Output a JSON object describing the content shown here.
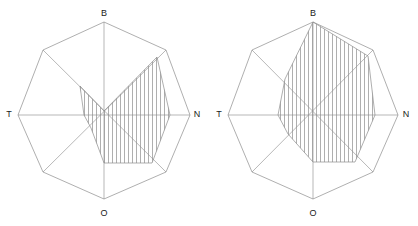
{
  "figure": {
    "width": 418,
    "height": 226,
    "background": "#ffffff",
    "stroke_color": "#8c8c8c",
    "axis_color": "#9a9a9a",
    "hatch_color": "#8c8c8c",
    "label_color": "#1a1a1a"
  },
  "chart_data": [
    {
      "id": "left-rose-diagram",
      "type": "line",
      "title": "",
      "xlabel": "",
      "ylabel": "",
      "grid": false,
      "legend": "none",
      "center": {
        "x": 104,
        "y": 111
      },
      "outer_radius": 88,
      "axis_labels": [
        {
          "name": "B",
          "angle_deg": 90,
          "x": 104,
          "y": 13
        },
        {
          "name": "N",
          "angle_deg": 0,
          "x": 197,
          "y": 114
        },
        {
          "name": "O",
          "angle_deg": 270,
          "x": 104,
          "y": 213
        },
        {
          "name": "T",
          "angle_deg": 180,
          "x": 9,
          "y": 114
        }
      ],
      "axes_drawn": [
        "B-O",
        "T-N",
        "NE-SW",
        "NW-SE"
      ],
      "outer_polygon": {
        "sides": 8,
        "categories": [
          "B",
          "BN",
          "N",
          "NO",
          "O",
          "OT",
          "T",
          "TB"
        ],
        "radii": [
          88,
          88,
          86,
          88,
          88,
          88,
          86,
          88
        ],
        "points": [
          {
            "x": 104,
            "y": 22
          },
          {
            "x": 166,
            "y": 50
          },
          {
            "x": 190,
            "y": 115
          },
          {
            "x": 166,
            "y": 172
          },
          {
            "x": 104,
            "y": 199
          },
          {
            "x": 43,
            "y": 172
          },
          {
            "x": 18,
            "y": 115
          },
          {
            "x": 43,
            "y": 50
          }
        ]
      },
      "inner_polygon": {
        "label": "hatched-sector-polygon",
        "fill": "vertical-hatch",
        "categories": [
          "B",
          "BN",
          "N",
          "NO",
          "O",
          "OT",
          "T",
          "TB"
        ],
        "values": [
          0.0,
          0.62,
          0.75,
          0.6,
          0.0,
          0.0,
          0.0,
          0.4
        ],
        "points": [
          {
            "x": 104,
            "y": 111
          },
          {
            "x": 157,
            "y": 57
          },
          {
            "x": 170,
            "y": 115
          },
          {
            "x": 152,
            "y": 163
          },
          {
            "x": 104,
            "y": 163
          },
          {
            "x": 91,
            "y": 128
          },
          {
            "x": 84,
            "y": 115
          },
          {
            "x": 80,
            "y": 86
          }
        ],
        "hatch_spacing_px": 4,
        "hatch_angle_deg": 90
      }
    },
    {
      "id": "right-rose-diagram",
      "type": "line",
      "title": "",
      "xlabel": "",
      "ylabel": "",
      "grid": false,
      "legend": "none",
      "center": {
        "x": 313,
        "y": 111
      },
      "outer_radius": 86,
      "axis_labels": [
        {
          "name": "B",
          "angle_deg": 90,
          "x": 313,
          "y": 13
        },
        {
          "name": "N",
          "angle_deg": 0,
          "x": 406,
          "y": 114
        },
        {
          "name": "O",
          "angle_deg": 270,
          "x": 313,
          "y": 213
        },
        {
          "name": "T",
          "angle_deg": 180,
          "x": 219,
          "y": 114
        }
      ],
      "axes_drawn": [
        "B-O",
        "T-N",
        "NE-SW",
        "NW-SE"
      ],
      "outer_polygon": {
        "sides": 8,
        "categories": [
          "B",
          "BN",
          "N",
          "NO",
          "O",
          "OT",
          "T",
          "TB"
        ],
        "radii": [
          89,
          86,
          85,
          86,
          89,
          86,
          85,
          86
        ],
        "points": [
          {
            "x": 313,
            "y": 22
          },
          {
            "x": 373,
            "y": 50
          },
          {
            "x": 398,
            "y": 115
          },
          {
            "x": 373,
            "y": 172
          },
          {
            "x": 313,
            "y": 199
          },
          {
            "x": 252,
            "y": 172
          },
          {
            "x": 228,
            "y": 115
          },
          {
            "x": 252,
            "y": 50
          }
        ]
      },
      "inner_polygon": {
        "label": "hatched-sector-polygon",
        "fill": "vertical-hatch",
        "categories": [
          "B",
          "BN",
          "N",
          "NO",
          "O",
          "OT",
          "T",
          "TB"
        ],
        "values": [
          1.0,
          0.66,
          0.72,
          0.62,
          0.0,
          0.0,
          0.0,
          0.45
        ],
        "points": [
          {
            "x": 313,
            "y": 22
          },
          {
            "x": 368,
            "y": 56
          },
          {
            "x": 375,
            "y": 115
          },
          {
            "x": 355,
            "y": 162
          },
          {
            "x": 313,
            "y": 162
          },
          {
            "x": 288,
            "y": 134
          },
          {
            "x": 278,
            "y": 115
          },
          {
            "x": 285,
            "y": 79
          }
        ],
        "hatch_spacing_px": 4,
        "hatch_angle_deg": 90
      }
    }
  ]
}
